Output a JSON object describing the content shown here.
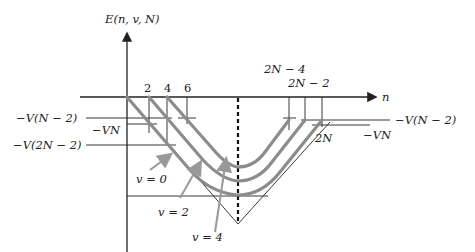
{
  "diagram": {
    "y_axis_label": "E(n, v, N)",
    "x_axis_label": "n",
    "x_ticks_top": [
      "2",
      "4",
      "6"
    ],
    "x_ticks_right": [
      "2N − 4",
      "2N − 2",
      "2N"
    ],
    "left_levels": [
      "−V(N − 2)",
      "−VN",
      "−V(2N − 2)"
    ],
    "right_levels": [
      "−V(N − 2)",
      "−VN"
    ],
    "curve_labels": [
      "v = 0",
      "v = 2",
      "v = 4"
    ],
    "colors": {
      "axis": "#222222",
      "curves": "#8c8c8c",
      "arrows": "#999999",
      "dashed_center": "#111111"
    }
  }
}
